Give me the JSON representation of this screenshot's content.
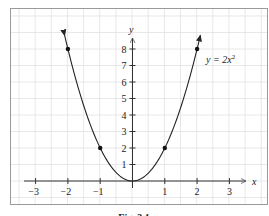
{
  "chart_data": {
    "type": "line",
    "title": "",
    "caption": "Fig. 3.1",
    "equation_label": {
      "prefix": "y = 2x",
      "superscript": "2"
    },
    "xlabel": "x",
    "ylabel": "y",
    "xlim": [
      -3.5,
      3.5
    ],
    "ylim": [
      0,
      9
    ],
    "x_ticks": [
      -3,
      -2,
      -1,
      1,
      2,
      3
    ],
    "x_tick_labels": [
      "−3",
      "−2",
      "−1",
      "1",
      "2",
      "3"
    ],
    "y_ticks": [
      1,
      2,
      3,
      4,
      5,
      6,
      7,
      8
    ],
    "y_tick_labels": [
      "1",
      "2",
      "3",
      "4",
      "5",
      "6",
      "7",
      "8"
    ],
    "grid": true,
    "series": [
      {
        "name": "y = 2x^2",
        "function": "2*x^2",
        "domain": [
          -2.1,
          2.1
        ],
        "arrows_at_ends": true,
        "color": "#222222"
      }
    ],
    "points": [
      {
        "x": -2,
        "y": 8
      },
      {
        "x": -1,
        "y": 2
      },
      {
        "x": 0,
        "y": 0
      },
      {
        "x": 1,
        "y": 2
      },
      {
        "x": 2,
        "y": 8
      }
    ]
  },
  "colors": {
    "axis": "#333333",
    "grid": "#e2e2e2",
    "frame": "#9a9a9a",
    "curve": "#222222"
  }
}
